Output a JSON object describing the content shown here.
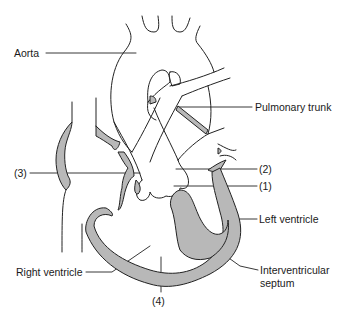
{
  "diagram": {
    "colors": {
      "line": "#222222",
      "muscle_fill": "#b8b8b8",
      "background": "#ffffff"
    },
    "labels": {
      "aorta": "Aorta",
      "pulmonary_trunk": "Pulmonary trunk",
      "marker_3": "(3)",
      "marker_2": "(2)",
      "marker_1": "(1)",
      "left_ventricle": "Left ventricle",
      "right_ventricle": "Right ventricle",
      "marker_4": "(4)",
      "interventricular_line1": "Interventricular",
      "interventricular_line2": "septum"
    }
  }
}
